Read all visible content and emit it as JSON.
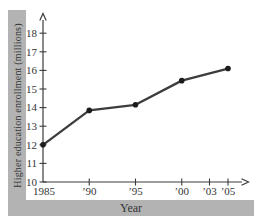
{
  "chart_data": {
    "type": "line",
    "title": "",
    "xlabel": "Year",
    "ylabel": "Higher education enrollment (millions)",
    "x": [
      1985,
      1990,
      1995,
      2000,
      2005
    ],
    "values": [
      12.0,
      13.85,
      14.15,
      15.45,
      16.1
    ],
    "y_ticks": [
      10,
      11,
      12,
      13,
      14,
      15,
      16,
      17,
      18
    ],
    "x_ticks": [
      {
        "year": 1985,
        "label": "1985"
      },
      {
        "year": 1990,
        "label": "’90"
      },
      {
        "year": 1995,
        "label": "’95"
      },
      {
        "year": 2000,
        "label": "’00"
      },
      {
        "year": 2003,
        "label": "’03"
      },
      {
        "year": 2005,
        "label": "’05"
      }
    ],
    "xlim": [
      1985,
      2007
    ],
    "ylim": [
      10,
      19
    ],
    "grid": false,
    "legend": "none",
    "band_color": "#b3b3b3",
    "axis_color": "#3b3b3b",
    "text_color": "#343434",
    "line_color": "#3d3d3d",
    "dot_color": "#1c1c1c"
  }
}
